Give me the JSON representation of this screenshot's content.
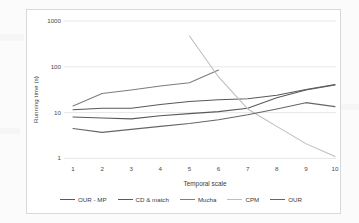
{
  "chart_data": {
    "type": "line",
    "title": "",
    "xlabel": "Temporal scale",
    "ylabel": "Running time (s)",
    "x": [
      1,
      2,
      3,
      4,
      5,
      6,
      7,
      8,
      9,
      10
    ],
    "xlim": [
      1,
      10
    ],
    "ylim": [
      1,
      1000
    ],
    "yscale": "log",
    "xtick_labels": [
      "1",
      "2",
      "3",
      "4",
      "5",
      "6",
      "7",
      "8",
      "9",
      "10"
    ],
    "ytick_labels": [
      "1000",
      "100",
      "10",
      "1"
    ],
    "ytick_values": [
      1000,
      100,
      10,
      1
    ],
    "grid": "horizontal",
    "legend_position": "bottom",
    "series": [
      {
        "name": "OUR - MP",
        "color": "#595959",
        "x": [
          1,
          2,
          3,
          4,
          5,
          6,
          7,
          8,
          9,
          10
        ],
        "values": [
          11.5,
          12.5,
          12.5,
          15.0,
          17.5,
          19.0,
          20.0,
          24.0,
          32.0,
          41.0
        ]
      },
      {
        "name": "CD & match",
        "color": "#5a5a5a",
        "x": [
          1,
          2,
          3,
          4,
          5,
          6,
          7,
          8,
          9,
          10
        ],
        "values": [
          8.0,
          7.6,
          7.3,
          8.5,
          9.5,
          10.5,
          12.5,
          21.0,
          31.0,
          40.0
        ]
      },
      {
        "name": "Mucha",
        "color": "#7d7d7d",
        "x": [
          1,
          2,
          3,
          4,
          5,
          6
        ],
        "values": [
          14.0,
          26.0,
          31.0,
          38.0,
          45.0,
          85.0
        ]
      },
      {
        "name": "CPM",
        "color": "#bdbdbd",
        "x": [
          5,
          6,
          7,
          8,
          9,
          10
        ],
        "values": [
          470.0,
          60.0,
          12.0,
          5.0,
          2.1,
          1.1
        ]
      },
      {
        "name": "OUR",
        "color": "#666666",
        "x": [
          1,
          2,
          3,
          4,
          5,
          6,
          7,
          8,
          9,
          10
        ],
        "values": [
          4.5,
          3.7,
          4.3,
          5.0,
          5.8,
          7.0,
          9.0,
          12.0,
          16.5,
          13.5
        ]
      }
    ]
  },
  "axes": {
    "ylabel": "Running time (s)",
    "xlabel": "Temporal scale"
  },
  "legend": {
    "items": [
      {
        "label": "OUR - MP",
        "color": "#595959"
      },
      {
        "label": "CD & match",
        "color": "#5a5a5a"
      },
      {
        "label": "Mucha",
        "color": "#7d7d7d"
      },
      {
        "label": "CPM",
        "color": "#bdbdbd"
      },
      {
        "label": "OUR",
        "color": "#666666"
      }
    ]
  }
}
